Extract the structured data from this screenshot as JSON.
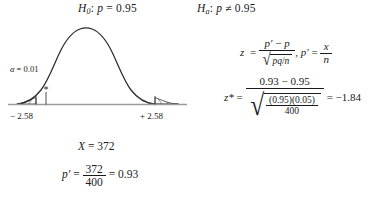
{
  "figure": {
    "type": "hypothesis-test-normal-curve",
    "title_null": "H_0: p = 0.95",
    "title_alt": "H_a: p ≠ 0.95"
  },
  "null_hypothesis": {
    "symbol": "H",
    "subscript": "0",
    "colon": ":",
    "param": "p",
    "relation": "=",
    "value": "0.95"
  },
  "alt_hypothesis": {
    "symbol": "H",
    "subscript": "a",
    "colon": ":",
    "param": "p",
    "relation": "≠",
    "value": "0.95"
  },
  "curve": {
    "alpha_label": "α = 0.01",
    "alpha_symbol": "α",
    "alpha_equals": "= 0.01",
    "alpha_value": 0.01,
    "left_critical_label": "− 2.58",
    "right_critical_label": "+ 2.58",
    "left_critical_value": -2.58,
    "right_critical_value": 2.58,
    "test_stat_marker": "*",
    "test_stat_value": -1.84,
    "tails": "two-tailed",
    "shaded_regions": "both tails hatched"
  },
  "formula_z": {
    "lhs": "z",
    "equals": "=",
    "numerator": "p′ − p",
    "numerator_parts": {
      "p_prime": "p",
      "prime": "′",
      "minus": "−",
      "p": "p"
    },
    "radicand": "pq/n",
    "radicand_parts": {
      "pq": "pq",
      "slash": "/",
      "n": "n"
    },
    "comma": ",",
    "second_lhs": "p′",
    "second_equals": "=",
    "second_numerator": "x",
    "second_denominator": "n"
  },
  "formula_zstar": {
    "lhs": "z*",
    "equals": "=",
    "numerator": "0.93 − 0.95",
    "numerator_parts": {
      "left": "0.93",
      "minus": "−",
      "right": "0.95"
    },
    "denominator_numerator": "(0.95)(0.05)",
    "denominator_numerator_parts": {
      "first": "(0.95)",
      "second": "(0.05)"
    },
    "denominator_denominator": "400",
    "result_equals": "=",
    "result": "−1.84"
  },
  "statements": {
    "x_symbol": "X",
    "x_equals": "=",
    "x_value": "372",
    "pprime_symbol": "p",
    "pprime_prime": "′",
    "pprime_equals": "=",
    "pprime_numerator": "372",
    "pprime_denominator": "400",
    "pprime_result_equals": "=",
    "pprime_result": "0.93"
  },
  "colors": {
    "ink": "#1a1a1a",
    "curve": "#2b2b2b",
    "axis": "#9a9a9a",
    "hatch": "#3a3a3a",
    "background": "#ffffff"
  }
}
